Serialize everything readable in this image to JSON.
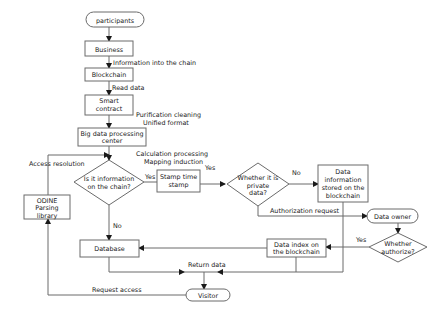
{
  "nodes": {
    "participants": "participants",
    "business": "Business",
    "blockchain": "Blockchain",
    "smart_contract": [
      "Smart",
      "contract"
    ],
    "big_data": [
      "Big data processing",
      "center"
    ],
    "is_on_chain": [
      "Is it information",
      "on the chain?"
    ],
    "stamp": [
      "Stamp time",
      "stamp"
    ],
    "is_private": [
      "Whether it is",
      "private",
      "data?"
    ],
    "stored": [
      "Data",
      "information",
      "stored on the",
      "blockchain"
    ],
    "data_owner": "Data owner",
    "authorize": [
      "Whether",
      "authorize?"
    ],
    "data_index": [
      "Data index on",
      "the blockchain"
    ],
    "database": "Database",
    "odine": [
      "ODINE",
      "Parsing",
      "library"
    ],
    "visitor": "Visitor"
  },
  "edge_labels": {
    "info_into_chain": "Information into the chain",
    "read_data": "Read data",
    "purification": [
      "Purification cleaning",
      "Unified format"
    ],
    "calculation": [
      "Calculation processing",
      "Mapping induction"
    ],
    "access_resolution": "Access resolution",
    "yes_onchain": "Yes",
    "yes_stamp": "Yes",
    "no_private": "No",
    "no_onchain": "No",
    "authorization_request": "Authorization request",
    "yes_authorize": "Yes",
    "return_data": "Return data",
    "request_access": "Request access"
  }
}
